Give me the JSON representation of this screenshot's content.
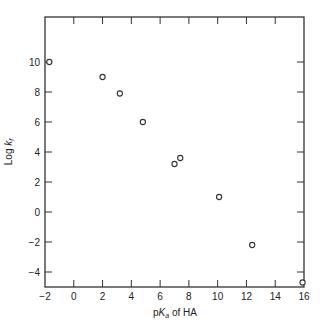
{
  "chart_data": {
    "type": "scatter",
    "title": "",
    "xlabel": "pKa of HA",
    "ylabel": "Log kf",
    "xlabel_parts": {
      "prefix": "p",
      "italic": "K",
      "sub": "a",
      "suffix": " of HA"
    },
    "ylabel_parts": {
      "prefix": "Log ",
      "italic": "k",
      "sub": "f"
    },
    "xlim": [
      -2,
      16
    ],
    "ylim": [
      -5,
      13
    ],
    "x_ticks": [
      -2,
      0,
      2,
      4,
      6,
      8,
      10,
      12,
      14,
      16
    ],
    "y_ticks": [
      -4,
      -2,
      0,
      2,
      4,
      6,
      8,
      10
    ],
    "grid": false,
    "legend": null,
    "marker": "open-circle",
    "series": [
      {
        "name": "data",
        "points": [
          {
            "x": -1.7,
            "y": 10.0
          },
          {
            "x": 2.0,
            "y": 9.0
          },
          {
            "x": 3.2,
            "y": 7.9
          },
          {
            "x": 4.8,
            "y": 6.0
          },
          {
            "x": 7.0,
            "y": 3.2
          },
          {
            "x": 7.4,
            "y": 3.6
          },
          {
            "x": 10.1,
            "y": 1.0
          },
          {
            "x": 12.4,
            "y": -2.2
          },
          {
            "x": 15.9,
            "y": -4.7
          }
        ]
      }
    ]
  }
}
